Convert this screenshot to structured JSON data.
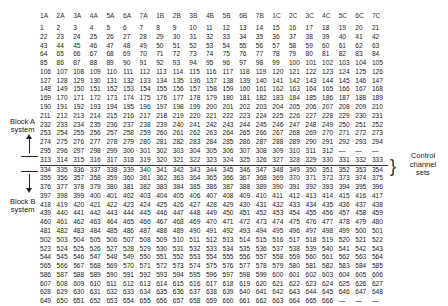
{
  "table": {
    "headers": [
      "1A",
      "2A",
      "3A",
      "4A",
      "5A",
      "6A",
      "7A",
      "1B",
      "2B",
      "3B",
      "4B",
      "5B",
      "6B",
      "7B",
      "1C",
      "2C",
      "3C",
      "4C",
      "5C",
      "6C",
      "7C"
    ],
    "rows": [
      [
        "1",
        "2",
        "3",
        "4",
        "5",
        "6",
        "7",
        "8",
        "9",
        "10",
        "11",
        "12",
        "13",
        "14",
        "15",
        "16",
        "17",
        "18",
        "19",
        "20",
        "21"
      ],
      [
        "22",
        "23",
        "24",
        "25",
        "26",
        "27",
        "28",
        "29",
        "30",
        "31",
        "32",
        "33",
        "34",
        "35",
        "36",
        "37",
        "38",
        "39",
        "40",
        "41",
        "42"
      ],
      [
        "43",
        "44",
        "45",
        "46",
        "47",
        "48",
        "49",
        "50",
        "51",
        "52",
        "53",
        "54",
        "55",
        "56",
        "57",
        "58",
        "59",
        "60",
        "61",
        "62",
        "63"
      ],
      [
        "64",
        "65",
        "66",
        "67",
        "68",
        "69",
        "70",
        "71",
        "72",
        "73",
        "74",
        "75",
        "76",
        "77",
        "78",
        "79",
        "80",
        "81",
        "82",
        "83",
        "84"
      ],
      [
        "85",
        "86",
        "87",
        "88",
        "89",
        "90",
        "91",
        "92",
        "93",
        "94",
        "95",
        "96",
        "97",
        "98",
        "99",
        "100",
        "101",
        "102",
        "103",
        "104",
        "105"
      ],
      [
        "106",
        "107",
        "108",
        "109",
        "110",
        "111",
        "112",
        "113",
        "114",
        "115",
        "116",
        "117",
        "118",
        "119",
        "120",
        "121",
        "122",
        "123",
        "124",
        "125",
        "126"
      ],
      [
        "127",
        "128",
        "129",
        "130",
        "131",
        "132",
        "133",
        "134",
        "135",
        "136",
        "137",
        "138",
        "139",
        "140",
        "141",
        "142",
        "143",
        "144",
        "145",
        "146",
        "147"
      ],
      [
        "148",
        "149",
        "150",
        "151",
        "152",
        "153",
        "154",
        "155",
        "156",
        "157",
        "158",
        "159",
        "160",
        "161",
        "162",
        "163",
        "164",
        "165",
        "166",
        "167",
        "168"
      ],
      [
        "169",
        "170",
        "171",
        "172",
        "173",
        "174",
        "175",
        "176",
        "177",
        "178",
        "179",
        "180",
        "181",
        "182",
        "183",
        "184",
        "185",
        "186",
        "187",
        "188",
        "189"
      ],
      [
        "190",
        "191",
        "192",
        "193",
        "194",
        "195",
        "196",
        "197",
        "198",
        "199",
        "200",
        "201",
        "202",
        "203",
        "204",
        "205",
        "206",
        "207",
        "208",
        "209",
        "210"
      ],
      [
        "211",
        "212",
        "213",
        "214",
        "215",
        "216",
        "217",
        "218",
        "219",
        "220",
        "221",
        "222",
        "223",
        "224",
        "225",
        "226",
        "227",
        "228",
        "229",
        "230",
        "231"
      ],
      [
        "232",
        "233",
        "234",
        "235",
        "236",
        "237",
        "238",
        "239",
        "240",
        "241",
        "242",
        "243",
        "244",
        "245",
        "246",
        "247",
        "248",
        "249",
        "250",
        "251",
        "252"
      ],
      [
        "253",
        "254",
        "255",
        "256",
        "257",
        "258",
        "259",
        "260",
        "261",
        "262",
        "263",
        "264",
        "265",
        "266",
        "267",
        "268",
        "269",
        "270",
        "271",
        "272",
        "273"
      ],
      [
        "274",
        "275",
        "276",
        "277",
        "278",
        "279",
        "280",
        "281",
        "282",
        "283",
        "284",
        "285",
        "286",
        "287",
        "288",
        "289",
        "290",
        "291",
        "292",
        "293",
        "294"
      ],
      [
        "295",
        "296",
        "297",
        "298",
        "299",
        "300",
        "301",
        "302",
        "303",
        "304",
        "305",
        "306",
        "307",
        "308",
        "309",
        "310",
        "311",
        "312",
        "—",
        "—",
        "—"
      ],
      [
        "313",
        "314",
        "315",
        "316",
        "317",
        "318",
        "319",
        "320",
        "321",
        "322",
        "323",
        "324",
        "325",
        "326",
        "327",
        "328",
        "329",
        "330",
        "331",
        "332",
        "333"
      ],
      [
        "334",
        "335",
        "336",
        "337",
        "338",
        "339",
        "340",
        "341",
        "342",
        "343",
        "344",
        "345",
        "346",
        "347",
        "348",
        "349",
        "350",
        "351",
        "352",
        "353",
        "354"
      ],
      [
        "355",
        "356",
        "357",
        "358",
        "359",
        "360",
        "361",
        "362",
        "363",
        "364",
        "365",
        "366",
        "367",
        "368",
        "369",
        "370",
        "371",
        "372",
        "373",
        "374",
        "375"
      ],
      [
        "376",
        "377",
        "378",
        "379",
        "380",
        "381",
        "382",
        "383",
        "384",
        "385",
        "386",
        "387",
        "388",
        "389",
        "390",
        "391",
        "392",
        "393",
        "394",
        "395",
        "396"
      ],
      [
        "397",
        "398",
        "399",
        "400",
        "401",
        "402",
        "403",
        "404",
        "405",
        "406",
        "407",
        "408",
        "409",
        "410",
        "411",
        "412",
        "413",
        "414",
        "415",
        "416",
        "417"
      ],
      [
        "418",
        "419",
        "420",
        "421",
        "422",
        "423",
        "424",
        "425",
        "426",
        "427",
        "428",
        "429",
        "430",
        "431",
        "432",
        "433",
        "434",
        "435",
        "436",
        "437",
        "438"
      ],
      [
        "439",
        "440",
        "441",
        "442",
        "443",
        "444",
        "445",
        "446",
        "447",
        "448",
        "449",
        "450",
        "451",
        "452",
        "453",
        "454",
        "455",
        "456",
        "457",
        "458",
        "459"
      ],
      [
        "460",
        "461",
        "462",
        "463",
        "464",
        "465",
        "466",
        "467",
        "468",
        "469",
        "470",
        "471",
        "472",
        "473",
        "474",
        "475",
        "476",
        "477",
        "478",
        "479",
        "480"
      ],
      [
        "481",
        "482",
        "483",
        "484",
        "485",
        "486",
        "487",
        "488",
        "489",
        "490",
        "491",
        "492",
        "493",
        "494",
        "495",
        "496",
        "497",
        "498",
        "499",
        "500",
        "501"
      ],
      [
        "502",
        "503",
        "504",
        "505",
        "506",
        "507",
        "508",
        "509",
        "510",
        "511",
        "512",
        "513",
        "514",
        "515",
        "516",
        "517",
        "518",
        "519",
        "520",
        "521",
        "522"
      ],
      [
        "523",
        "524",
        "525",
        "526",
        "527",
        "528",
        "529",
        "530",
        "531",
        "532",
        "533",
        "534",
        "535",
        "536",
        "537",
        "538",
        "539",
        "540",
        "541",
        "542",
        "543"
      ],
      [
        "544",
        "545",
        "546",
        "547",
        "548",
        "549",
        "550",
        "551",
        "552",
        "553",
        "554",
        "555",
        "556",
        "557",
        "558",
        "559",
        "560",
        "561",
        "562",
        "563",
        "564"
      ],
      [
        "565",
        "566",
        "567",
        "568",
        "569",
        "570",
        "571",
        "572",
        "573",
        "574",
        "575",
        "576",
        "577",
        "578",
        "579",
        "580",
        "581",
        "582",
        "583",
        "584",
        "585"
      ],
      [
        "586",
        "587",
        "588",
        "589",
        "590",
        "591",
        "592",
        "593",
        "594",
        "595",
        "596",
        "597",
        "598",
        "599",
        "600",
        "601",
        "602",
        "603",
        "604",
        "605",
        "606"
      ],
      [
        "607",
        "608",
        "609",
        "610",
        "611",
        "612",
        "613",
        "614",
        "615",
        "616",
        "617",
        "618",
        "619",
        "620",
        "621",
        "622",
        "623",
        "624",
        "625",
        "626",
        "627"
      ],
      [
        "628",
        "629",
        "630",
        "631",
        "632",
        "633",
        "634",
        "635",
        "636",
        "637",
        "638",
        "639",
        "640",
        "641",
        "642",
        "643",
        "644",
        "645",
        "646",
        "647",
        "648"
      ],
      [
        "649",
        "650",
        "651",
        "652",
        "653",
        "654",
        "655",
        "656",
        "657",
        "658",
        "659",
        "660",
        "661",
        "662",
        "663",
        "664",
        "665",
        "666",
        "—",
        "—",
        "—"
      ]
    ],
    "separator_after_row_index": 15
  },
  "annotations": {
    "block_a": "Block A\nsystem",
    "block_b": "Block B\nsystem",
    "control": "Control\nchannel\nsets"
  }
}
